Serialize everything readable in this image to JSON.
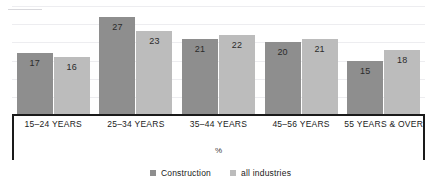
{
  "chart_data": {
    "type": "bar",
    "title": "",
    "xlabel": "",
    "ylabel": "%",
    "ylim": [
      0,
      30
    ],
    "grid": true,
    "legend_position": "bottom",
    "categories": [
      "15–24 YEARS",
      "25–34 YEARS",
      "35–44 YEARS",
      "45–56 YEARS",
      "55 YEARS & OVER"
    ],
    "series": [
      {
        "name": "Construction",
        "color": "#8e8e8e",
        "values": [
          17,
          27,
          21,
          20,
          15
        ]
      },
      {
        "name": "all industries",
        "color": "#bcbcbc",
        "values": [
          16,
          23,
          22,
          21,
          18
        ]
      }
    ],
    "data_labels": [
      [
        "17",
        "16"
      ],
      [
        "27",
        "23"
      ],
      [
        "21",
        "22"
      ],
      [
        "20",
        "21"
      ],
      [
        "15",
        "18"
      ]
    ],
    "axis_unit_label": "%",
    "gridline_values": [
      5,
      10,
      15,
      20,
      25,
      30
    ]
  },
  "legend": {
    "items": [
      {
        "label": "Construction",
        "color": "#8e8e8e"
      },
      {
        "label": "all industries",
        "color": "#bcbcbc"
      }
    ]
  },
  "colors": {
    "construction": "#8e8e8e",
    "all_industries": "#bcbcbc",
    "axis": "#1a1a1a",
    "gridline": "#ededf0",
    "background": "#ffffff"
  },
  "title_remnant": {
    "text": ""
  }
}
